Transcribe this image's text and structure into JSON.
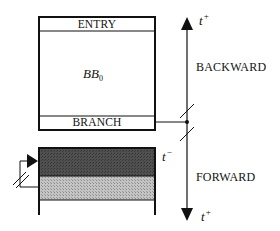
{
  "diagram": {
    "block": {
      "entry_label": "ENTRY",
      "name_main": "BB",
      "name_sub": "0",
      "branch_label": "BRANCH"
    },
    "timeline": {
      "top_var": "t",
      "top_sup": "+",
      "bottom_var": "t",
      "bottom_sup": "+",
      "backward_label": "BACKWARD",
      "forward_label": "FORWARD"
    },
    "lower_block": {
      "marker_var": "t",
      "marker_sup": "−"
    },
    "colors": {
      "line": "#111111",
      "dark_band": "#4a4a4a",
      "light_band": "#b4b4b4"
    }
  }
}
